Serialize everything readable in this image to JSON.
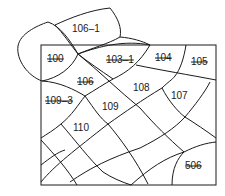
{
  "figure": {
    "type": "patent-style mesh diagram",
    "stroke_color": "#1a1a1a",
    "background": "#ffffff"
  },
  "labels": [
    {
      "id": "106-1",
      "text": "106–1",
      "x": 72,
      "y": 32,
      "struck": false
    },
    {
      "id": "100",
      "text": "100",
      "x": 47,
      "y": 62,
      "struck": true
    },
    {
      "id": "103-1",
      "text": "103–1",
      "x": 106,
      "y": 63,
      "struck": true
    },
    {
      "id": "104",
      "text": "104",
      "x": 155,
      "y": 61,
      "struck": true
    },
    {
      "id": "105",
      "text": "105",
      "x": 191,
      "y": 65,
      "struck": true
    },
    {
      "id": "106",
      "text": "106",
      "x": 77,
      "y": 85,
      "struck": true
    },
    {
      "id": "108",
      "text": "108",
      "x": 133,
      "y": 91,
      "struck": false
    },
    {
      "id": "107",
      "text": "107",
      "x": 171,
      "y": 99,
      "struck": false
    },
    {
      "id": "109-3",
      "text": "109–3",
      "x": 45,
      "y": 104,
      "struck": true
    },
    {
      "id": "109",
      "text": "109",
      "x": 102,
      "y": 110,
      "struck": false
    },
    {
      "id": "110",
      "text": "110",
      "x": 73,
      "y": 131,
      "struck": false
    },
    {
      "id": "506",
      "text": "506",
      "x": 185,
      "y": 169,
      "struck": true
    }
  ]
}
